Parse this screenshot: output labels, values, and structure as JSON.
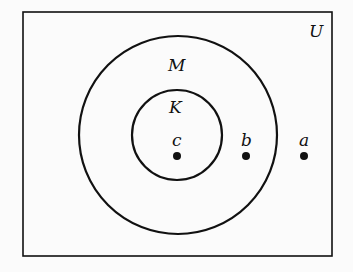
{
  "diagram": {
    "type": "venn",
    "universe_label": "U",
    "sets": [
      {
        "label": "M",
        "contains": [
          "K"
        ]
      },
      {
        "label": "K"
      }
    ],
    "points": [
      {
        "label": "c",
        "in": [
          "K",
          "M"
        ]
      },
      {
        "label": "b",
        "in": [
          "M"
        ]
      },
      {
        "label": "a",
        "in": []
      }
    ]
  },
  "colors": {
    "stroke": "#111111",
    "background": "#fbfbfb"
  }
}
